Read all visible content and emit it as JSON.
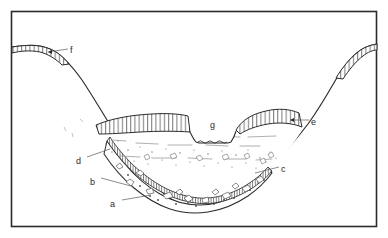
{
  "figure": {
    "type": "geological-cross-section",
    "frame": {
      "border_color": "#2b2b2b",
      "background_color": "#ffffff",
      "x": 11,
      "y": 11,
      "width": 366,
      "height": 216
    },
    "line_color": "#2b2b2b",
    "hatch_color": "#3a3a3a",
    "stipple_color": "#6d6d6d"
  },
  "labels": [
    {
      "id": "a",
      "text": "a",
      "x": 110,
      "y": 199,
      "target": "basal-clast-gravel-bed",
      "leader": {
        "x1": 122,
        "y1": 200,
        "x2": 151,
        "y2": 195
      }
    },
    {
      "id": "b",
      "text": "b",
      "x": 90,
      "y": 177,
      "target": "hatched-gravel-band",
      "leader": {
        "x1": 101,
        "y1": 178,
        "x2": 131,
        "y2": 186
      }
    },
    {
      "id": "c",
      "text": "c",
      "x": 281,
      "y": 164,
      "target": "stippled-sand-unit-right",
      "leader": {
        "x1": 279,
        "y1": 167,
        "x2": 255,
        "y2": 173
      }
    },
    {
      "id": "d",
      "text": "d",
      "x": 76,
      "y": 156,
      "target": "upper-slope-contact-left",
      "leader": {
        "x1": 87,
        "y1": 157,
        "x2": 110,
        "y2": 149
      }
    },
    {
      "id": "e",
      "text": "e",
      "x": 311,
      "y": 117,
      "target": "hatched-terrace-right",
      "leader": {
        "x1": 309,
        "y1": 120,
        "x2": 290,
        "y2": 120
      }
    },
    {
      "id": "f",
      "text": "f",
      "x": 70,
      "y": 45,
      "target": "hatched-terrace-upper-left",
      "leader": {
        "x1": 68,
        "y1": 49,
        "x2": 48,
        "y2": 52
      }
    },
    {
      "id": "g",
      "text": "g",
      "x": 210,
      "y": 120,
      "target": "river-channel-water"
    }
  ],
  "units": [
    {
      "name": "bedrock-valley-wall",
      "pattern": "plain-outline"
    },
    {
      "name": "basal-clast-gravel-bed",
      "pattern": "angular-clasts"
    },
    {
      "name": "hatched-gravel-band",
      "pattern": "vertical-hatch-band"
    },
    {
      "name": "stippled-sand-unit",
      "pattern": "stipple-and-dashes"
    },
    {
      "name": "hatched-terrace-left",
      "pattern": "vertical-hatch"
    },
    {
      "name": "hatched-terrace-right",
      "pattern": "vertical-hatch"
    },
    {
      "name": "hatched-terrace-upper-left",
      "pattern": "vertical-hatch"
    },
    {
      "name": "hatched-terrace-upper-right",
      "pattern": "vertical-hatch"
    },
    {
      "name": "river-channel-water",
      "pattern": "wavy-water-surface"
    }
  ]
}
